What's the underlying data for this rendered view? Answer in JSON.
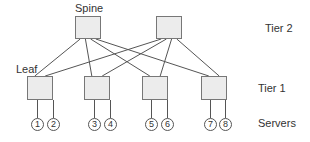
{
  "labels": {
    "spine": "Spine",
    "leaf": "Leaf",
    "tier2": "Tier 2",
    "tier1": "Tier 1",
    "servers": "Servers"
  },
  "spines": [
    {
      "id": "spine-1",
      "x": 75,
      "y": 16,
      "w": 26,
      "h": 23
    },
    {
      "id": "spine-2",
      "x": 156,
      "y": 16,
      "w": 26,
      "h": 23
    }
  ],
  "leaves": [
    {
      "id": "leaf-1",
      "x": 27,
      "y": 76,
      "w": 26,
      "h": 24
    },
    {
      "id": "leaf-2",
      "x": 84,
      "y": 76,
      "w": 26,
      "h": 24
    },
    {
      "id": "leaf-3",
      "x": 142,
      "y": 76,
      "w": 26,
      "h": 24
    },
    {
      "id": "leaf-4",
      "x": 201,
      "y": 76,
      "w": 26,
      "h": 24
    }
  ],
  "servers": [
    {
      "label": "1",
      "x": 31
    },
    {
      "label": "2",
      "x": 47
    },
    {
      "label": "3",
      "x": 88
    },
    {
      "label": "4",
      "x": 104
    },
    {
      "label": "5",
      "x": 145
    },
    {
      "label": "6",
      "x": 161
    },
    {
      "label": "7",
      "x": 204
    },
    {
      "label": "8",
      "x": 219
    }
  ],
  "colors": {
    "node_fill": "#ececec",
    "node_border": "#777777",
    "line": "#555555",
    "text": "#333333"
  }
}
